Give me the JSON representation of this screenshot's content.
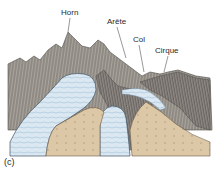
{
  "figure": {
    "panel_label": "(c)",
    "labels": {
      "horn": "Horn",
      "arete": "Arête",
      "col": "Col",
      "cirque": "Cirque"
    },
    "colors": {
      "rock_gray": "#a9a49c",
      "rock_dark": "#6e6a66",
      "ice_blue": "#d6e6f1",
      "ice_shadow": "#9fbfd6",
      "moraine_tan": "#d9c4a2",
      "moraine_dark": "#bfa57e",
      "background": "#ffffff"
    }
  }
}
